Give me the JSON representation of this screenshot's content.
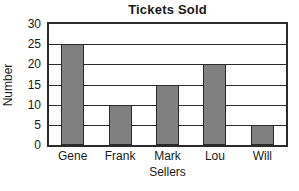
{
  "chart_data": {
    "type": "bar",
    "title": "Tickets Sold",
    "xlabel": "Sellers",
    "ylabel": "Number",
    "categories": [
      "Gene",
      "Frank",
      "Mark",
      "Lou",
      "Will"
    ],
    "values": [
      25,
      10,
      15,
      20,
      5
    ],
    "ylim": [
      0,
      30
    ],
    "yticks": [
      0,
      5,
      10,
      15,
      20,
      25,
      30
    ],
    "ytick_labels": [
      "0",
      "5",
      "10",
      "15",
      "20",
      "25",
      "30"
    ],
    "grid": "horizontal",
    "legend": null,
    "colors": {
      "bar_fill": "#808080",
      "bar_edge": "#2b2b2b",
      "axis": "#2b2b2b",
      "grid": "#2b2b2b",
      "background": "#ffffff",
      "text": "#1a1a1a"
    }
  }
}
